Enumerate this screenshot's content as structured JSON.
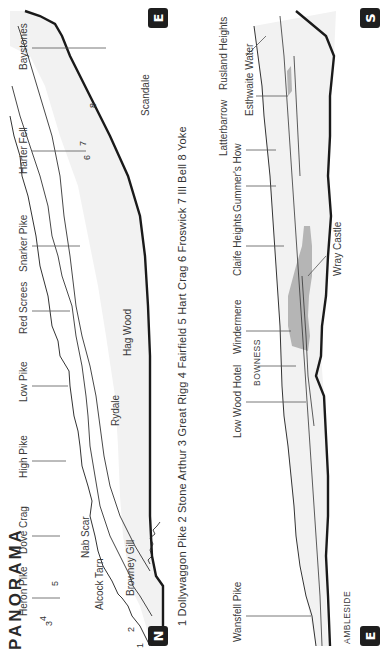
{
  "title": "PANORAMA",
  "upper_panel": {
    "start_badge": "N",
    "end_badge": "E",
    "peak_labels": [
      "Heron Pike",
      "Dove Crag",
      "High Pike",
      "Low Pike",
      "Red Screes",
      "Snarker Pike",
      "Harter Fell",
      "Baystones"
    ],
    "feature_labels": [
      "Alcock Tarn",
      "Browney Gill",
      "Nab Scar",
      "Rydale",
      "Hag Wood",
      "Scandale"
    ],
    "numbers": [
      "1",
      "2",
      "3",
      "4",
      "5",
      "6",
      "7",
      "8"
    ]
  },
  "legend": {
    "text": "1 Dollywaggon Pike  2 Stone Arthur  3 Great Rigg  4 Fairfield  5 Hart Crag  6 Froswick  7 Ill Bell  8 Yoke",
    "items": [
      {
        "num": "1",
        "name": "Dollywaggon Pike"
      },
      {
        "num": "2",
        "name": "Stone Arthur"
      },
      {
        "num": "3",
        "name": "Great Rigg"
      },
      {
        "num": "4",
        "name": "Fairfield"
      },
      {
        "num": "5",
        "name": "Hart Crag"
      },
      {
        "num": "6",
        "name": "Froswick"
      },
      {
        "num": "7",
        "name": "Ill Bell"
      },
      {
        "num": "8",
        "name": "Yoke"
      }
    ]
  },
  "lower_panel": {
    "start_badge": "E",
    "end_badge": "S",
    "peak_labels": [
      "Wansfell Pike",
      "Low Wood Hotel",
      "Windermere",
      "Claife Heights",
      "Gummer's How",
      "Latterbarrow",
      "Rusland Heights"
    ],
    "feature_labels": [
      "AMBLESIDE",
      "BOWNESS",
      "Wray Castle",
      "Esthwaite Water"
    ]
  },
  "colors": {
    "badge": "#1e1e1e",
    "land_fill": "#f2f2f2",
    "water_fill": "#b5b5b5",
    "outline": "#222222"
  }
}
